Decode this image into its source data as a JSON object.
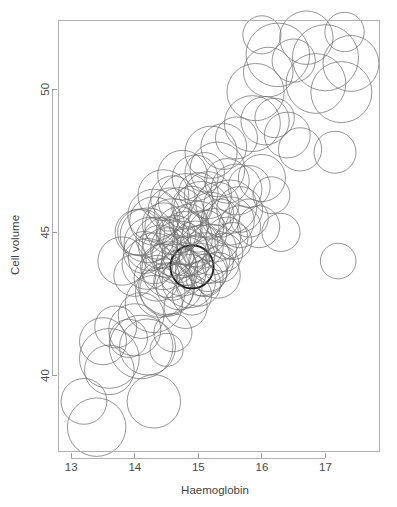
{
  "chart_data": {
    "type": "scatter",
    "variant": "bubble",
    "title": "",
    "subtitle": "",
    "xlabel": "Haemoglobin",
    "ylabel": "Cell volume",
    "xlim": [
      12.8,
      17.85
    ],
    "ylim": [
      37.35,
      52.4
    ],
    "xticks": [
      13,
      14,
      15,
      16,
      17
    ],
    "xticklabels": [
      "13",
      "14",
      "15",
      "16",
      "17"
    ],
    "yticks": [
      40,
      45,
      50
    ],
    "yticklabels": [
      "40",
      "45",
      "50"
    ],
    "grid": false,
    "legend": null,
    "legend_position": "none",
    "marker": "open-circle",
    "size_encoding": "radius",
    "n_points": 121,
    "series": [
      {
        "name": "blood sample",
        "x": [
          13.4,
          13.2,
          14.3,
          13.6,
          13.6,
          13.5,
          13.9,
          14.1,
          14.2,
          14.5,
          13.7,
          14.0,
          14.1,
          14.6,
          14.3,
          14.4,
          14.8,
          14.5,
          14.7,
          14.9,
          13.8,
          14.0,
          14.2,
          14.35,
          14.5,
          14.6,
          14.75,
          14.85,
          15.0,
          15.1,
          14.15,
          14.3,
          14.45,
          14.55,
          14.65,
          14.8,
          14.9,
          15.05,
          15.15,
          15.3,
          14.25,
          14.4,
          14.5,
          14.6,
          14.7,
          14.8,
          14.95,
          15.1,
          15.2,
          15.35,
          14.05,
          14.2,
          14.35,
          14.5,
          14.65,
          14.8,
          14.95,
          15.05,
          15.2,
          15.4,
          14.3,
          14.45,
          14.6,
          14.7,
          14.85,
          15.0,
          15.1,
          15.25,
          15.45,
          15.55,
          14.1,
          14.3,
          14.55,
          14.7,
          14.9,
          15.05,
          15.2,
          15.35,
          15.5,
          15.65,
          14.45,
          14.6,
          14.8,
          15.0,
          15.15,
          15.3,
          15.5,
          15.65,
          15.8,
          15.95,
          14.75,
          14.95,
          15.1,
          15.3,
          15.45,
          15.6,
          15.8,
          16.0,
          16.15,
          16.3,
          15.2,
          15.4,
          15.6,
          15.85,
          16.05,
          16.2,
          16.4,
          16.6,
          16.85,
          17.15,
          15.9,
          16.1,
          16.25,
          16.5,
          16.7,
          17.0,
          17.25,
          17.4,
          16.0,
          17.2,
          17.3
        ],
        "y": [
          38.2,
          39.1,
          39.1,
          40.2,
          40.6,
          41.2,
          41.3,
          41.0,
          41.0,
          40.9,
          41.7,
          41.6,
          42.1,
          41.5,
          42.5,
          42.9,
          42.4,
          43.0,
          43.1,
          42.8,
          44.0,
          43.5,
          43.9,
          43.4,
          43.1,
          43.3,
          43.6,
          43.3,
          43.2,
          43.4,
          44.3,
          44.1,
          43.8,
          43.7,
          43.9,
          44.0,
          43.8,
          43.7,
          43.6,
          43.5,
          44.6,
          44.5,
          44.3,
          44.2,
          44.4,
          44.3,
          44.2,
          44.1,
          44.0,
          43.9,
          45.0,
          44.9,
          44.8,
          44.7,
          44.9,
          44.8,
          44.6,
          44.5,
          44.4,
          44.3,
          45.4,
          45.3,
          45.2,
          45.1,
          45.3,
          45.2,
          45.0,
          44.9,
          44.8,
          44.7,
          45.0,
          45.6,
          45.8,
          45.7,
          45.9,
          45.8,
          45.6,
          45.5,
          45.4,
          45.2,
          46.3,
          46.2,
          46.1,
          46.4,
          46.3,
          46.0,
          45.9,
          45.8,
          45.5,
          45.2,
          47.0,
          46.9,
          47.1,
          47.2,
          46.8,
          46.5,
          46.6,
          46.9,
          46.3,
          45.0,
          47.8,
          48.0,
          48.3,
          48.8,
          48.9,
          49.0,
          48.4,
          47.9,
          50.2,
          47.8,
          49.9,
          50.6,
          51.2,
          51.0,
          51.8,
          51.1,
          49.9,
          50.9,
          51.9,
          44.0,
          52.0
        ],
        "r": [
          0.46,
          0.36,
          0.42,
          0.39,
          0.47,
          0.37,
          0.3,
          0.5,
          0.44,
          0.26,
          0.33,
          0.41,
          0.36,
          0.3,
          0.45,
          0.39,
          0.34,
          0.42,
          0.36,
          0.31,
          0.38,
          0.33,
          0.4,
          0.36,
          0.44,
          0.3,
          0.37,
          0.42,
          0.35,
          0.29,
          0.33,
          0.4,
          0.36,
          0.44,
          0.31,
          0.38,
          0.34,
          0.41,
          0.3,
          0.36,
          0.42,
          0.34,
          0.39,
          0.33,
          0.45,
          0.37,
          0.31,
          0.4,
          0.35,
          0.29,
          0.36,
          0.43,
          0.33,
          0.38,
          0.31,
          0.42,
          0.36,
          0.34,
          0.4,
          0.3,
          0.38,
          0.33,
          0.44,
          0.36,
          0.31,
          0.4,
          0.35,
          0.42,
          0.33,
          0.29,
          0.37,
          0.41,
          0.34,
          0.39,
          0.32,
          0.44,
          0.36,
          0.3,
          0.38,
          0.33,
          0.4,
          0.35,
          0.43,
          0.31,
          0.37,
          0.34,
          0.42,
          0.36,
          0.3,
          0.33,
          0.39,
          0.36,
          0.31,
          0.43,
          0.35,
          0.4,
          0.33,
          0.37,
          0.29,
          0.3,
          0.41,
          0.36,
          0.33,
          0.44,
          0.38,
          0.31,
          0.36,
          0.34,
          0.47,
          0.33,
          0.45,
          0.39,
          0.5,
          0.34,
          0.42,
          0.52,
          0.48,
          0.44,
          0.3,
          0.28,
          0.31
        ],
        "emphasis_index": 36
      }
    ]
  }
}
